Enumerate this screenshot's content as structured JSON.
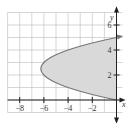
{
  "chart_data": {
    "type": "area",
    "title": "",
    "xlabel": "x",
    "ylabel": "y",
    "xlim": [
      -9,
      0.5
    ],
    "ylim": [
      -1,
      7
    ],
    "grid": true,
    "x_ticks": [
      {
        "value": -8,
        "label": "−8"
      },
      {
        "value": -6,
        "label": "−6"
      },
      {
        "value": -4,
        "label": "−4"
      },
      {
        "value": -2,
        "label": "−2"
      }
    ],
    "y_ticks": [
      {
        "value": 2,
        "label": "2"
      },
      {
        "value": 4,
        "label": "4"
      },
      {
        "value": 6,
        "label": "6"
      }
    ],
    "curve": {
      "description": "Parabola opening left, x = y^2 - 5y, from (0,0) to (0,5), vertex near (-6.25, 2.5)",
      "points": [
        {
          "x": 0,
          "y": 0
        },
        {
          "x": -2.25,
          "y": 0.5
        },
        {
          "x": -4,
          "y": 1
        },
        {
          "x": -5.25,
          "y": 1.5
        },
        {
          "x": -6,
          "y": 2
        },
        {
          "x": -6.25,
          "y": 2.5
        },
        {
          "x": -6,
          "y": 3
        },
        {
          "x": -5.25,
          "y": 3.5
        },
        {
          "x": -4,
          "y": 4
        },
        {
          "x": -2.25,
          "y": 4.5
        },
        {
          "x": 0,
          "y": 5
        }
      ]
    },
    "shaded_region": "Region between parabola and y-axis (x from y^2-5y to 0, y in [0,5])",
    "colors": {
      "fill": "#d9d9d9",
      "curve": "#777777",
      "grid": "#bbbbbb",
      "axis": "#222222"
    }
  }
}
